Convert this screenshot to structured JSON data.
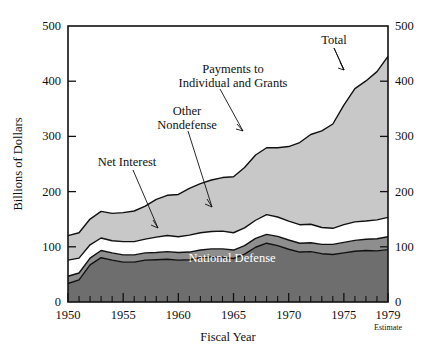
{
  "chart_data": {
    "type": "area",
    "subtype": "stacked-area",
    "title": "",
    "xlabel": "Fiscal Year",
    "ylabel": "Billions of Dollars",
    "xlim": [
      1950,
      1979
    ],
    "ylim": [
      0,
      500
    ],
    "y_ticks": [
      0,
      100,
      200,
      300,
      400,
      500
    ],
    "y_tick_labels": [
      "0",
      "100",
      "200",
      "300",
      "400",
      "500"
    ],
    "y_axis_right": true,
    "y_ticks_right": [
      0,
      100,
      200,
      300,
      400,
      500
    ],
    "y_tick_labels_right": [
      "0",
      "100",
      "200",
      "300",
      "400",
      "500"
    ],
    "x_ticks": [
      1950,
      1955,
      1960,
      1965,
      1970,
      1975,
      1979
    ],
    "x_tick_labels": [
      "1950",
      "1955",
      "1960",
      "1965",
      "1970",
      "1975",
      "1979"
    ],
    "x_minor_ticks_every": 1,
    "grid": false,
    "legend": "inline-annotations",
    "x": [
      1950,
      1951,
      1952,
      1953,
      1954,
      1955,
      1956,
      1957,
      1958,
      1959,
      1960,
      1961,
      1962,
      1963,
      1964,
      1965,
      1966,
      1967,
      1968,
      1969,
      1970,
      1971,
      1972,
      1973,
      1974,
      1975,
      1976,
      1977,
      1978,
      1979
    ],
    "series": [
      {
        "name": "National Defense",
        "color": "#6e6e6e",
        "values": [
          46,
          55,
          92,
          110,
          104,
          99,
          99,
          104,
          105,
          106,
          104,
          105,
          110,
          112,
          111,
          108,
          119,
          136,
          146,
          140,
          131,
          124,
          125,
          120,
          118,
          122,
          126,
          128,
          127,
          130
        ]
      },
      {
        "name": "Net Interest",
        "color": "#8e8e8e",
        "values": [
          18,
          17,
          17,
          18,
          18,
          18,
          18,
          18,
          18,
          19,
          19,
          19,
          19,
          20,
          21,
          21,
          21,
          22,
          22,
          23,
          23,
          22,
          22,
          23,
          25,
          26,
          27,
          28,
          30,
          32
        ]
      },
      {
        "name": "Other Nondefense",
        "color": "#ffffff",
        "values": [
          40,
          37,
          33,
          31,
          30,
          33,
          33,
          34,
          38,
          40,
          39,
          42,
          43,
          43,
          44,
          43,
          44,
          45,
          49,
          48,
          47,
          46,
          46,
          42,
          40,
          44,
          46,
          45,
          47,
          48
        ]
      },
      {
        "name": "Payments to Individual and Grants",
        "color": "#c8c8c8",
        "values": [
          61,
          63,
          64,
          66,
          68,
          72,
          76,
          82,
          94,
          100,
          105,
          116,
          122,
          128,
          133,
          139,
          150,
          162,
          166,
          172,
          185,
          204,
          223,
          240,
          259,
          297,
          331,
          348,
          368,
          400
        ]
      }
    ],
    "total": {
      "name": "Total",
      "values": [
        165,
        172,
        206,
        225,
        220,
        222,
        226,
        238,
        255,
        265,
        267,
        282,
        294,
        303,
        309,
        311,
        334,
        365,
        383,
        383,
        386,
        396,
        416,
        425,
        442,
        489,
        530,
        549,
        572,
        610
      ]
    },
    "annotations": [
      {
        "id": "total",
        "label": "Total",
        "x_pct": 76.5,
        "y_pct": 12.0
      },
      {
        "id": "payments",
        "label_line1": "Payments to",
        "label_line2": "Individual and Grants",
        "x_pct": 53.0,
        "y_pct": 22.0
      },
      {
        "id": "other-nondefense",
        "label_line1": "Other",
        "label_line2": "Nondefense",
        "x_pct": 43.0,
        "y_pct": 33.0
      },
      {
        "id": "net-interest",
        "label": "Net Interest",
        "x_pct": 30.0,
        "y_pct": 47.0
      },
      {
        "id": "national-defense",
        "label": "National Defense",
        "x_pct": 55.0,
        "y_pct": 74.0
      }
    ],
    "footnote": "Estimate"
  },
  "axes": {
    "y_label": "Billions of Dollars",
    "x_label": "Fiscal Year",
    "y_ticks": [
      "500",
      "400",
      "300",
      "200",
      "100",
      "0"
    ],
    "y_ticks_right": [
      "500",
      "400",
      "300",
      "200",
      "100",
      "0"
    ],
    "x_ticks": [
      "1950",
      "1955",
      "1960",
      "1965",
      "1970",
      "1975",
      "1979"
    ],
    "estimate_note": "Estimate"
  },
  "labels": {
    "total": "Total",
    "payments_line1": "Payments to",
    "payments_line2": "Individual and Grants",
    "other_line1": "Other",
    "other_line2": "Nondefense",
    "net_interest": "Net Interest",
    "national_defense": "National Defense"
  },
  "colors": {
    "national_defense": "#6e6e6e",
    "net_interest": "#8e8e8e",
    "other_nondefense": "#ffffff",
    "payments": "#c8c8c8",
    "outline": "#111111",
    "background": "#ffffff"
  }
}
